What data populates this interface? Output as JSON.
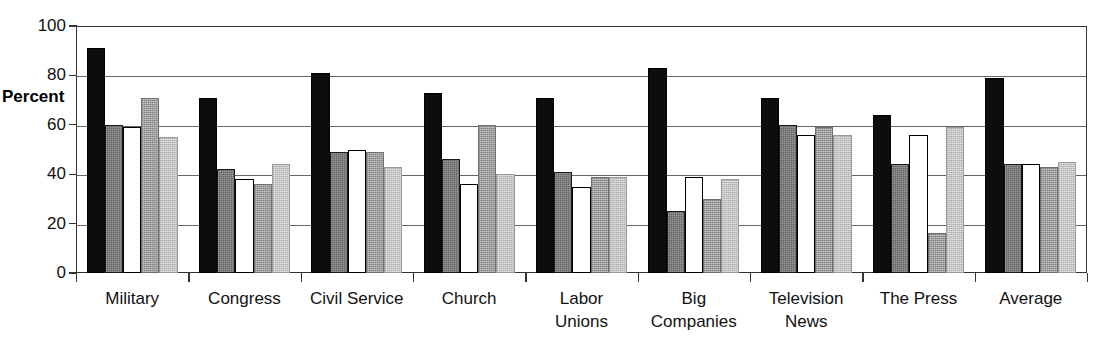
{
  "chart_data": {
    "type": "bar",
    "title": "",
    "xlabel": "",
    "ylabel": "Percent",
    "ylim": [
      0,
      100
    ],
    "y_ticks": [
      0,
      20,
      40,
      60,
      80,
      100
    ],
    "y_tick_labels": [
      "0",
      "20",
      "40",
      "60",
      "80",
      "100"
    ],
    "grid": true,
    "legend": "none",
    "orientation": "vertical",
    "grouped": true,
    "categories": [
      "Military",
      "Congress",
      "Civil Service",
      "Church",
      "Labor Unions",
      "Big Companies",
      "Television News",
      "The Press",
      "Average"
    ],
    "category_lines": [
      [
        "Military",
        ""
      ],
      [
        "Congress",
        ""
      ],
      [
        "Civil Service",
        ""
      ],
      [
        "Church",
        ""
      ],
      [
        "Labor",
        "Unions"
      ],
      [
        "Big",
        "Companies"
      ],
      [
        "Television",
        "News"
      ],
      [
        "The Press",
        ""
      ],
      [
        "Average",
        ""
      ]
    ],
    "series": [
      {
        "name": "series-1",
        "fill": "black",
        "color": "#0d0d0d",
        "values": [
          91,
          71,
          81,
          73,
          71,
          83,
          71,
          64,
          79
        ]
      },
      {
        "name": "series-2",
        "fill": "dark-gray",
        "color": "#666666",
        "values": [
          60,
          42,
          49,
          46,
          41,
          25,
          60,
          44,
          44
        ]
      },
      {
        "name": "series-3",
        "fill": "white",
        "color": "#ffffff",
        "values": [
          59,
          38,
          50,
          36,
          35,
          39,
          56,
          56,
          44
        ]
      },
      {
        "name": "series-4",
        "fill": "medium-gray",
        "color": "#9d9d9d",
        "values": [
          71,
          36,
          49,
          60,
          39,
          30,
          59,
          16,
          43
        ]
      },
      {
        "name": "series-5",
        "fill": "light-gray",
        "color": "#c2c2c2",
        "values": [
          55,
          44,
          43,
          40,
          39,
          38,
          56,
          59,
          45
        ]
      }
    ]
  }
}
